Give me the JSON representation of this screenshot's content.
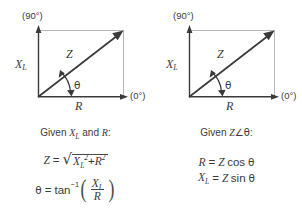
{
  "figure": {
    "type": "phasor-triangle-pair",
    "panels": [
      {
        "id": "left",
        "diagram": {
          "axis_top_label": "(90°)",
          "axis_right_label": "(0°)",
          "vertical_label": "X",
          "vertical_sub": "L",
          "hypotenuse_label": "Z",
          "horizontal_label": "R",
          "angle_label": "θ"
        },
        "caption_prefix": "Given ",
        "caption_var1": "X",
        "caption_var1_sub": "L",
        "caption_and": " and ",
        "caption_var2": "R",
        "caption_suffix": ":",
        "formula1": {
          "lhs": "Z",
          "eq": "=",
          "radicand_a": "X",
          "radicand_a_sub": "L",
          "radicand_a_pow": "2",
          "plus": "+",
          "radicand_b": "R",
          "radicand_b_pow": "2"
        },
        "formula2": {
          "lhs": "θ",
          "eq": "=",
          "fn": "tan",
          "fn_sup": "−1",
          "num": "X",
          "num_sub": "L",
          "den": "R"
        }
      },
      {
        "id": "right",
        "diagram": {
          "axis_top_label": "(90°)",
          "axis_right_label": "(0°)",
          "vertical_label": "X",
          "vertical_sub": "L",
          "hypotenuse_label": "Z",
          "horizontal_label": "R",
          "angle_label": "θ"
        },
        "caption_prefix": "Given ",
        "caption_var1": "Z",
        "caption_angle": "∠",
        "caption_var2": "θ",
        "caption_suffix": ":",
        "formula1": {
          "lhs": "R",
          "eq": "=",
          "mag": "Z",
          "fn": "cos",
          "arg": "θ"
        },
        "formula2": {
          "lhs": "X",
          "lhs_sub": "L",
          "eq": "=",
          "mag": "Z",
          "fn": "sin",
          "arg": "θ"
        }
      }
    ],
    "colors": {
      "stroke_dark": "#3a3a3a",
      "stroke_light": "#b8b8b8",
      "text": "#3a3a3a",
      "background": "#ffffff"
    }
  }
}
